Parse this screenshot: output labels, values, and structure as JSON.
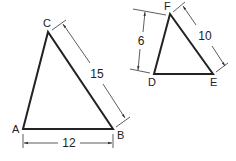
{
  "diagram": {
    "type": "similar-triangles",
    "triangle1": {
      "vertices": {
        "A": "A",
        "B": "B",
        "C": "C"
      },
      "dimensions": {
        "AB": "12",
        "BC": "15"
      }
    },
    "triangle2": {
      "vertices": {
        "D": "D",
        "E": "E",
        "F": "F"
      },
      "dimensions": {
        "DF": "6",
        "EF": "10"
      }
    },
    "colors": {
      "line": "#222222",
      "dimension": "#333333",
      "background": "#ffffff"
    }
  }
}
